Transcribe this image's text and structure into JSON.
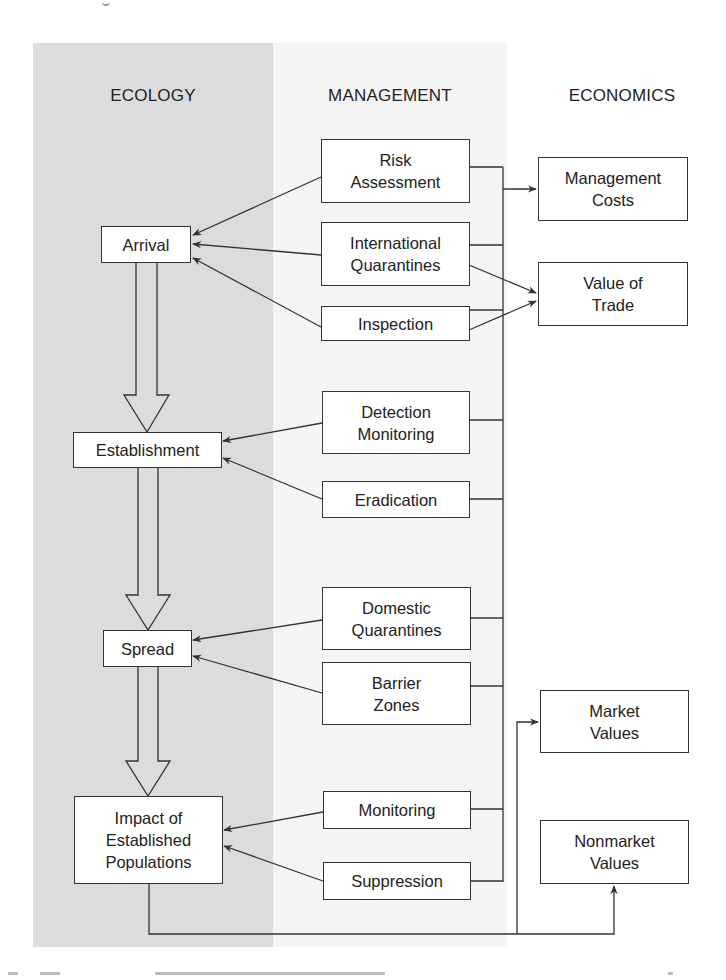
{
  "columns": {
    "ecology": "ECOLOGY",
    "management": "MANAGEMENT",
    "economics": "ECONOMICS"
  },
  "ecology_stages": [
    {
      "id": "arrival",
      "label": "Arrival"
    },
    {
      "id": "establishment",
      "label": "Establishment"
    },
    {
      "id": "spread",
      "label": "Spread"
    },
    {
      "id": "impact",
      "label": "Impact of\nEstablished\nPopulations"
    }
  ],
  "management_actions": [
    {
      "id": "risk-assessment",
      "label": "Risk\nAssessment",
      "targets": "arrival"
    },
    {
      "id": "international-quarantines",
      "label": "International\nQuarantines",
      "targets": "arrival"
    },
    {
      "id": "inspection",
      "label": "Inspection",
      "targets": "arrival"
    },
    {
      "id": "detection-monitoring",
      "label": "Detection\nMonitoring",
      "targets": "establishment"
    },
    {
      "id": "eradication",
      "label": "Eradication",
      "targets": "establishment"
    },
    {
      "id": "domestic-quarantines",
      "label": "Domestic\nQuarantines",
      "targets": "spread"
    },
    {
      "id": "barrier-zones",
      "label": "Barrier\nZones",
      "targets": "spread"
    },
    {
      "id": "monitoring",
      "label": "Monitoring",
      "targets": "impact"
    },
    {
      "id": "suppression",
      "label": "Suppression",
      "targets": "impact"
    }
  ],
  "economic_outcomes": [
    {
      "id": "management-costs",
      "label": "Management\nCosts"
    },
    {
      "id": "value-of-trade",
      "label": "Value of\nTrade"
    },
    {
      "id": "market-values",
      "label": "Market\nValues"
    },
    {
      "id": "nonmarket-values",
      "label": "Nonmarket\nValues"
    }
  ],
  "colors": {
    "ecology_panel": "#dcdcdc",
    "management_panel": "#f5f5f5",
    "line": "#333333"
  }
}
